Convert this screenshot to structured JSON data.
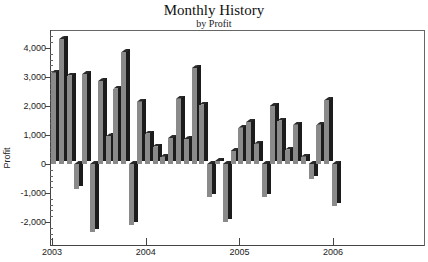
{
  "chart_data": {
    "type": "bar",
    "style": "3d",
    "title": "Monthly History",
    "subtitle": "by Profit",
    "xlabel": "",
    "ylabel": "Profit",
    "ylim": [
      -2700,
      4400
    ],
    "yticks": [
      "4,000",
      "3,000",
      "2,000",
      "1,000",
      "0",
      "-1,000",
      "-2,000"
    ],
    "ytick_values": [
      4000,
      3000,
      2000,
      1000,
      0,
      -1000,
      -2000
    ],
    "xticks": [
      "2003",
      "2004",
      "2005",
      "2006"
    ],
    "grid": false,
    "legend": null,
    "categories": [
      "2003-01",
      "2003-02",
      "2003-03",
      "2003-04",
      "2003-05",
      "2003-06",
      "2003-07",
      "2003-08",
      "2003-09",
      "2003-10",
      "2003-11",
      "2003-12",
      "2004-01",
      "2004-02",
      "2004-03",
      "2004-04",
      "2004-05",
      "2004-06",
      "2004-07",
      "2004-08",
      "2004-09",
      "2004-10",
      "2004-11",
      "2004-12",
      "2005-01",
      "2005-02",
      "2005-03",
      "2005-04",
      "2005-05",
      "2005-06",
      "2005-07",
      "2005-08",
      "2005-09",
      "2005-10",
      "2005-11",
      "2005-12",
      "2006-01"
    ],
    "series": [
      {
        "name": "Profit",
        "values": [
          3150,
          4300,
          3050,
          -850,
          3100,
          -2350,
          2850,
          950,
          2600,
          3850,
          -2100,
          2150,
          1050,
          600,
          250,
          900,
          2250,
          850,
          3300,
          2050,
          -1150,
          100,
          -2000,
          450,
          1250,
          1450,
          700,
          -1150,
          2000,
          1500,
          500,
          1350,
          250,
          -500,
          1350,
          2200,
          -1450
        ]
      }
    ],
    "colors": {
      "front": "#8a8a8a",
      "side": "#1c1c1c",
      "axis": "#444444"
    }
  }
}
